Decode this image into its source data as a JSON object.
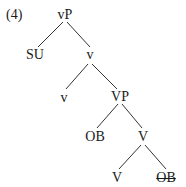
{
  "example_number": "(4)",
  "tree": {
    "nodes": {
      "root": "vP",
      "subject": "SU",
      "vbar": "v",
      "v_head": "v",
      "vp": "VP",
      "object": "OB",
      "vbar2": "V",
      "v_lower": "V",
      "object_trace": "OB"
    },
    "struck_nodes": [
      "object_trace"
    ]
  }
}
